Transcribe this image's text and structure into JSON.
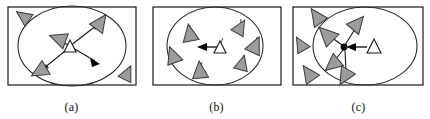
{
  "figure": {
    "panel_count": 3,
    "background_color": "#ffffff"
  },
  "style": {
    "frame_stroke": "#1a1a1a",
    "frame_fill": "#ffffff",
    "frame_stroke_width": 1.2,
    "circle_stroke": "#2a2a2a",
    "circle_stroke_width": 1.1,
    "circle_fill": "none",
    "agent_fill": "#9c9c9c",
    "agent_stroke": "#3a3a3a",
    "agent_stroke_width": 1.0,
    "leader_fill": "#ffffff",
    "leader_stroke": "#1a1a1a",
    "arrow_stroke": "#1a1a1a",
    "arrow_head_fill": "#000000",
    "stem_stroke": "#4a4a4a",
    "caption_color": "#111111"
  },
  "panels": [
    {
      "id": "a",
      "caption": "(a)",
      "frame": {
        "x": 8,
        "y": 7,
        "w": 128,
        "h": 78
      },
      "circle": {
        "cx": 72,
        "cy": 46,
        "rx": 54,
        "ry": 40
      },
      "leader": {
        "x": 70,
        "y": 46,
        "type": "open-triangle",
        "size": 7
      },
      "agents": [
        {
          "x": 24,
          "y": 17,
          "rot": -55,
          "size": 9,
          "inside_circle": false
        },
        {
          "x": 99,
          "y": 22,
          "rot": 35,
          "size": 10,
          "inside_circle": true
        },
        {
          "x": 59,
          "y": 39,
          "rot": -70,
          "size": 10,
          "inside_circle": true
        },
        {
          "x": 41,
          "y": 70,
          "rot": -120,
          "size": 10,
          "inside_circle": true
        },
        {
          "x": 127,
          "y": 74,
          "rot": 25,
          "size": 9,
          "inside_circle": false
        }
      ],
      "arrows": [
        {
          "x1": 70,
          "y1": 46,
          "x2": 97,
          "y2": 25,
          "head": true,
          "label": "to-upper-right-agent"
        },
        {
          "x1": 70,
          "y1": 46,
          "x2": 61,
          "y2": 41,
          "head": false,
          "label": "to-left-agent"
        },
        {
          "x1": 70,
          "y1": 46,
          "x2": 43,
          "y2": 68,
          "head": true,
          "label": "to-lower-left-agent"
        },
        {
          "x1": 72,
          "y1": 48,
          "x2": 97,
          "y2": 62,
          "head": true,
          "label": "motion-direction"
        }
      ],
      "description": "Leader emits attraction vectors outward to scattered agents; swarm is dispersed."
    },
    {
      "id": "b",
      "caption": "(b)",
      "frame": {
        "x": 8,
        "y": 7,
        "w": 128,
        "h": 78
      },
      "circle": {
        "cx": 70,
        "cy": 46,
        "rx": 48,
        "ry": 39
      },
      "leader": {
        "x": 74,
        "y": 48,
        "type": "open-triangle",
        "size": 7
      },
      "agents": [
        {
          "x": 45,
          "y": 32,
          "rot": -10,
          "size": 10,
          "inside_circle": true,
          "stem": true
        },
        {
          "x": 94,
          "y": 26,
          "rot": 30,
          "size": 9,
          "inside_circle": true,
          "stem": true
        },
        {
          "x": 109,
          "y": 45,
          "rot": 25,
          "size": 10,
          "inside_circle": true,
          "stem": true
        },
        {
          "x": 28,
          "y": 55,
          "rot": -20,
          "size": 10,
          "inside_circle": true,
          "stem": true
        },
        {
          "x": 96,
          "y": 63,
          "rot": 15,
          "size": 9,
          "inside_circle": true,
          "stem": true
        },
        {
          "x": 55,
          "y": 71,
          "rot": -5,
          "size": 10,
          "inside_circle": true,
          "stem": true
        }
      ],
      "arrows": [
        {
          "x1": 73,
          "y1": 47,
          "x2": 54,
          "y2": 47,
          "head": true,
          "label": "leader-heading-left"
        }
      ],
      "description": "Agents have aggregated uniformly inside the region; leader heading left."
    },
    {
      "id": "c",
      "caption": "(c)",
      "frame": {
        "x": 6,
        "y": 7,
        "w": 130,
        "h": 78
      },
      "circle": {
        "cx": 78,
        "cy": 46,
        "rx": 52,
        "ry": 39
      },
      "leader": {
        "x": 86,
        "y": 47,
        "type": "open-triangle",
        "size": 8
      },
      "hub": {
        "x": 57,
        "y": 47,
        "r": 3.2
      },
      "agents": [
        {
          "x": 30,
          "y": 16,
          "rot": -35,
          "size": 10,
          "inside_circle": false
        },
        {
          "x": 70,
          "y": 23,
          "rot": 40,
          "size": 10,
          "inside_circle": true
        },
        {
          "x": 40,
          "y": 35,
          "rot": -45,
          "size": 11,
          "inside_circle": true
        },
        {
          "x": 14,
          "y": 45,
          "rot": -30,
          "size": 9,
          "inside_circle": false
        },
        {
          "x": 47,
          "y": 63,
          "rot": -130,
          "size": 10,
          "inside_circle": true
        },
        {
          "x": 22,
          "y": 74,
          "rot": -35,
          "size": 10,
          "inside_circle": false
        },
        {
          "x": 58,
          "y": 76,
          "rot": -150,
          "size": 10,
          "inside_circle": true
        }
      ],
      "arrows": [
        {
          "x1": 70,
          "y1": 25,
          "x2": 58,
          "y2": 45,
          "head": false,
          "label": "from-upper-agent"
        },
        {
          "x1": 43,
          "y1": 36,
          "x2": 56,
          "y2": 45,
          "head": false,
          "label": "from-upper-left-agent"
        },
        {
          "x1": 57,
          "y1": 49,
          "x2": 48,
          "y2": 61,
          "head": false,
          "label": "to-lower-left-agent"
        },
        {
          "x1": 58,
          "y1": 49,
          "x2": 59,
          "y2": 73,
          "head": false,
          "label": "to-bottom-agent"
        },
        {
          "x1": 80,
          "y1": 47,
          "x2": 61,
          "y2": 47,
          "head": true,
          "label": "leader-to-hub"
        }
      ],
      "description": "Agents converge on a single hub node; leader approaches the cluster from the right."
    }
  ]
}
